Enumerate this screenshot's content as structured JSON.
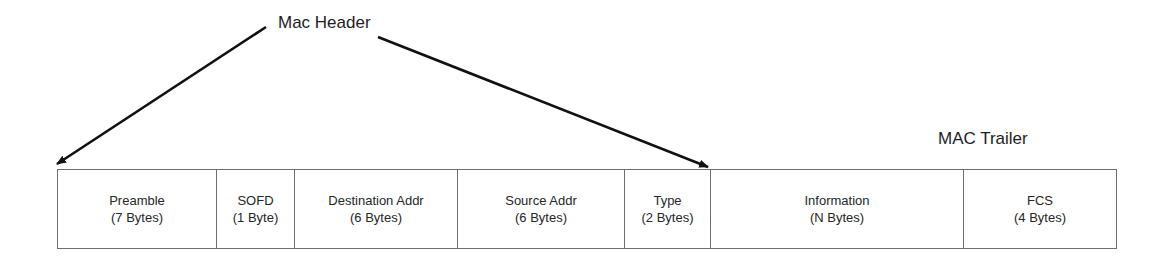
{
  "diagram": {
    "header_label": "Mac Header",
    "trailer_label": "MAC Trailer",
    "fields": [
      {
        "name": "Preamble",
        "size": "(7 Bytes)",
        "width": 159
      },
      {
        "name": "SOFD",
        "size": "(1 Byte)",
        "width": 78
      },
      {
        "name": "Destination Addr",
        "size": "(6 Bytes)",
        "width": 163
      },
      {
        "name": "Source Addr",
        "size": "(6 Bytes)",
        "width": 167
      },
      {
        "name": "Type",
        "size": "(2 Bytes)",
        "width": 86
      },
      {
        "name": "Information",
        "size": "(N Bytes)",
        "width": 253
      },
      {
        "name": "FCS",
        "size": "(4 Bytes)",
        "width": 154
      }
    ],
    "arrows": [
      {
        "from": "Mac Header",
        "to": "Preamble (left edge)"
      },
      {
        "from": "Mac Header",
        "to": "Type (right edge)"
      }
    ],
    "colors": {
      "line": "#111111",
      "border": "#6e6e6e",
      "text": "#262626"
    }
  }
}
